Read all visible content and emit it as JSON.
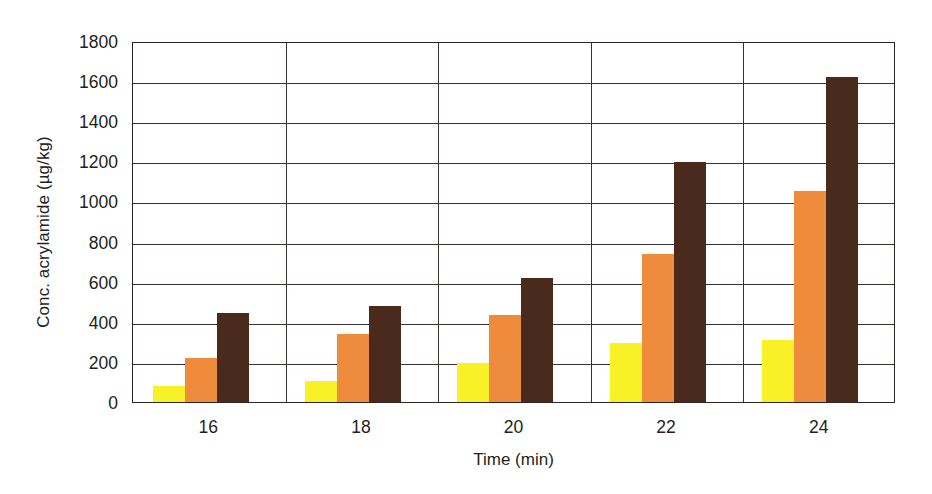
{
  "chart_data": {
    "type": "bar",
    "title": "",
    "xlabel": "Time (min)",
    "ylabel": "Conc. acrylamide (µg/kg)",
    "categories": [
      "16",
      "18",
      "20",
      "22",
      "24"
    ],
    "ylim": [
      0,
      1800
    ],
    "ytick_step": 200,
    "yticks": [
      "1800",
      "1600",
      "1400",
      "1200",
      "1000",
      "800",
      "600",
      "400",
      "200",
      "0"
    ],
    "ytick_values": [
      1800,
      1600,
      1400,
      1200,
      1000,
      800,
      600,
      400,
      200,
      0
    ],
    "grid": "horizontal-and-vertical",
    "legend": "none",
    "series": [
      {
        "name": "series-1",
        "color": "#f9f128",
        "values": [
          80,
          105,
          195,
          295,
          310
        ]
      },
      {
        "name": "series-2",
        "color": "#ef8b3c",
        "values": [
          220,
          340,
          435,
          740,
          1050
        ]
      },
      {
        "name": "series-3",
        "color": "#4a2a1c",
        "values": [
          445,
          480,
          620,
          1195,
          1620
        ]
      }
    ]
  },
  "colors": {
    "series_1": "#f9f128",
    "series_2": "#ef8b3c",
    "series_3": "#4a2a1c",
    "axis": "#2b2422",
    "grid": "#3a3230",
    "text": "#231f20",
    "background": "#ffffff"
  }
}
